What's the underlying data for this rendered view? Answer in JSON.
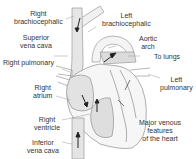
{
  "diagram": {
    "title": "Major venous features of the heart",
    "caption": [
      "Major venous",
      "features",
      "of the heart"
    ],
    "labels": {
      "right_brachiocephalic": [
        "Right",
        "brachiocephalic"
      ],
      "left_brachiocephalic": [
        "Left",
        "brachiocephalic"
      ],
      "superior_vena_cava": [
        "Superior",
        "vena cava"
      ],
      "aortic_arch": [
        "Aortic",
        "arch"
      ],
      "to_lungs": "To lungs",
      "right_pulmonary": "Right pulmonary",
      "left_pulmonary": [
        "Left",
        "pulmonary"
      ],
      "right_atrium": [
        "Right",
        "atrium"
      ],
      "right_ventricle": [
        "Right",
        "ventricle"
      ],
      "inferior_vena_cava": [
        "Inferior",
        "vena cava"
      ]
    },
    "colors": {
      "outline": "#9a9a9a",
      "vessel_fill": "#e6e6e6",
      "shade": "#d4d4d4",
      "arrow": "#222222",
      "text": "#333333"
    }
  }
}
